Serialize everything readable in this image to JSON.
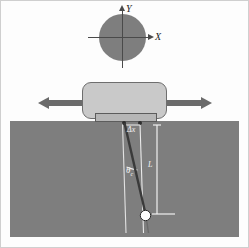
{
  "figure": {
    "title": "",
    "background_color": "#fdfdfd",
    "border_color": "#cfcfcf"
  },
  "coordinate_system": {
    "name": "xy-axes-over-disc",
    "disc_color": "#7e7e7e",
    "axis_color": "#4a4a4a",
    "x_axis_label": "X",
    "y_axis_label": "Y",
    "x_axis_direction": "right",
    "y_axis_direction": "up"
  },
  "cart": {
    "name": "sliding-block",
    "fill_color": "#c9c9c9",
    "stroke_color": "#6e6e6e",
    "slot_fill_color": "#b6b6b6",
    "slot_stroke_color": "#5c5c5c"
  },
  "arrows": {
    "left": {
      "label": "",
      "direction": "left",
      "color": "#6b6b6b"
    },
    "right": {
      "label": "",
      "direction": "right",
      "color": "#6b6b6b"
    }
  },
  "medium": {
    "name": "substrate-block",
    "fill_color": "#7e7e7e"
  },
  "pendulum": {
    "rod_color": "#3a3a3a",
    "reference_line_color": "#e6e6e6",
    "bob_color": "#ffffff",
    "bob_stroke_color": "#2a2a2a",
    "labels": {
      "displacement": "Δx",
      "angle": "θ",
      "angle_subscript": "c",
      "length": "L"
    }
  }
}
